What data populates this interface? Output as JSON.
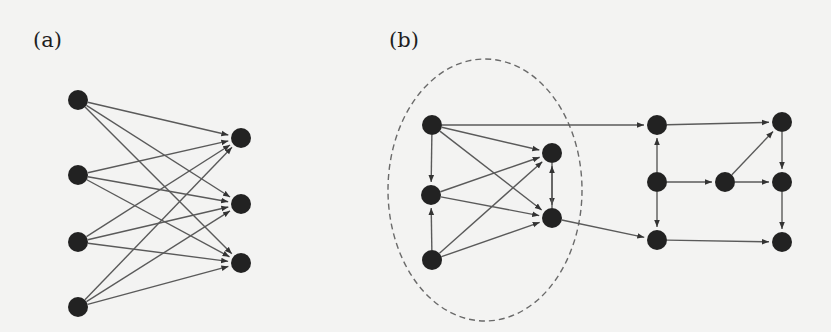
{
  "labels": {
    "panel_a": "(a)",
    "panel_b": "(b)"
  },
  "colors": {
    "background": "#f3f3f2",
    "node": "#222222",
    "edge": "#5a5a5a",
    "cluster_outline": "#6a6a6a"
  },
  "panel_a": {
    "description": "Fully connected bipartite directed network: 4 source nodes to 3 target nodes",
    "node_radius": 10,
    "nodes": [
      {
        "id": "a1",
        "x": 78,
        "y": 100
      },
      {
        "id": "a2",
        "x": 78,
        "y": 175
      },
      {
        "id": "a3",
        "x": 78,
        "y": 242
      },
      {
        "id": "a4",
        "x": 78,
        "y": 307
      },
      {
        "id": "a5",
        "x": 241,
        "y": 138
      },
      {
        "id": "a6",
        "x": 241,
        "y": 204
      },
      {
        "id": "a7",
        "x": 241,
        "y": 263
      }
    ],
    "edges": [
      [
        "a1",
        "a5"
      ],
      [
        "a1",
        "a6"
      ],
      [
        "a1",
        "a7"
      ],
      [
        "a2",
        "a5"
      ],
      [
        "a2",
        "a6"
      ],
      [
        "a2",
        "a7"
      ],
      [
        "a3",
        "a5"
      ],
      [
        "a3",
        "a6"
      ],
      [
        "a3",
        "a7"
      ],
      [
        "a4",
        "a5"
      ],
      [
        "a4",
        "a6"
      ],
      [
        "a4",
        "a7"
      ]
    ]
  },
  "panel_b": {
    "description": "Directed network with a dashed-ellipse highlighted cluster of 5 nodes",
    "node_radius": 10,
    "cluster": {
      "cx": 485,
      "cy": 190,
      "rx": 97,
      "ry": 131
    },
    "nodes": [
      {
        "id": "A",
        "x": 432,
        "y": 125
      },
      {
        "id": "B",
        "x": 431,
        "y": 195
      },
      {
        "id": "C",
        "x": 432,
        "y": 260
      },
      {
        "id": "D",
        "x": 552,
        "y": 153
      },
      {
        "id": "E",
        "x": 552,
        "y": 218
      },
      {
        "id": "F",
        "x": 657,
        "y": 125
      },
      {
        "id": "G",
        "x": 782,
        "y": 122
      },
      {
        "id": "H",
        "x": 657,
        "y": 182
      },
      {
        "id": "I",
        "x": 725,
        "y": 182
      },
      {
        "id": "J",
        "x": 782,
        "y": 182
      },
      {
        "id": "K",
        "x": 657,
        "y": 240
      },
      {
        "id": "L",
        "x": 782,
        "y": 242
      }
    ],
    "edges": [
      [
        "A",
        "B"
      ],
      [
        "C",
        "B"
      ],
      [
        "A",
        "D"
      ],
      [
        "A",
        "E"
      ],
      [
        "B",
        "D"
      ],
      [
        "B",
        "E"
      ],
      [
        "C",
        "D"
      ],
      [
        "C",
        "E"
      ],
      [
        "D",
        "E"
      ],
      [
        "E",
        "D"
      ],
      [
        "A",
        "F"
      ],
      [
        "E",
        "K"
      ],
      [
        "F",
        "G"
      ],
      [
        "H",
        "F"
      ],
      [
        "H",
        "I"
      ],
      [
        "H",
        "K"
      ],
      [
        "I",
        "G"
      ],
      [
        "I",
        "J"
      ],
      [
        "G",
        "J"
      ],
      [
        "J",
        "L"
      ],
      [
        "K",
        "L"
      ]
    ]
  }
}
